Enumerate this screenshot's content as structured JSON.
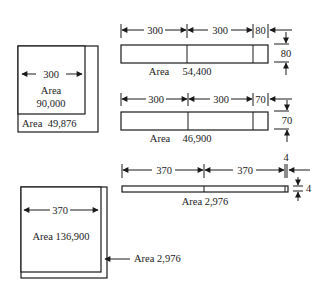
{
  "figure": {
    "square_300": {
      "dimension": "300",
      "inner_label": "Area",
      "inner_value": "90,000",
      "border_label": "Area  49,876"
    },
    "strip_80": {
      "dims": [
        "300",
        "300",
        "80"
      ],
      "height_dim": "80",
      "area_label": "Area",
      "area_value": "54,400"
    },
    "strip_70": {
      "dims": [
        "300",
        "300",
        "70"
      ],
      "height_dim": "70",
      "area_label": "Area",
      "area_value": "46,900"
    },
    "strip_4": {
      "dims": [
        "370",
        "370",
        "4"
      ],
      "height_dim": "4",
      "area_label": "Area 2,976"
    },
    "square_370": {
      "dimension": "370",
      "inner_label": "Area 136,900",
      "border_callout": "Area 2,976"
    }
  },
  "colors": {
    "ink": "#1a1a1a",
    "background": "#ffffff"
  }
}
